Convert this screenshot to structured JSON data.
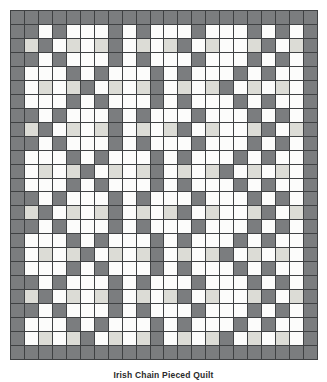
{
  "figure": {
    "title": "Irish Chain Pieced Quilt",
    "caption": "Irish Chain Pieced Quilt",
    "type": "quilt-pattern-diagram"
  },
  "palette": {
    "dark": "#7b7d7f",
    "white": "#fcfcfb",
    "light": "#dcdcd6",
    "grid_line": "#3f4143",
    "background": "#ffffff"
  },
  "chart_data": {
    "type": "heatmap",
    "title": "Irish Chain Pieced Quilt",
    "xlabel": "",
    "ylabel": "",
    "columns": 22,
    "rows": 25,
    "legend": [
      {
        "key": "D",
        "label": "dark",
        "color": "#7b7d7f"
      },
      {
        "key": "W",
        "label": "white",
        "color": "#fcfcfb"
      },
      {
        "key": "L",
        "label": "light",
        "color": "#dcdcd6"
      }
    ],
    "grid": [
      "DDDDDDDDDDDDDDDDDDDDDD",
      "DDWDWWWDWDWWWDWWWDWDWD",
      "DLDWLWLDWLWLDWLWWLDWLD",
      "DDWDWWWDWDWWWDWWWDWDWD",
      "DWWWDWDWWWDWDWWWDWDWWD",
      "DWLWLDWLWLDWLWLDWLWLWD",
      "DWWWDWDWWWDWDWWWDWDWWD",
      "DDWDWWWDWDWWWDWWWDWDWD",
      "DLDWLWLDWLWLDWLWWLDWLD",
      "DDWDWWWDWDWWWDWWWDWDWD",
      "DWWWDWDWWWDWDWWWDWDWWD",
      "DWLWLDWLWLDWLWLDWLWLWD",
      "DWWWDWDWWWDWDWWWDWDWWD",
      "DDWDWWWDWDWWWDWWWDWDWD",
      "DLDWLWLDWLWLDWLWWLDWLD",
      "DDWDWWWDWDWWWDWWWDWDWD",
      "DWWWDWDWWWDWDWWWDWDWWD",
      "DWLWLDWLWLDWLWLDWLWLWD",
      "DWWWDWDWWWDWDWWWDWDWWD",
      "DDWDWWWDWDWWWDWWWDWDWD",
      "DLDWLWLDWLWLDWLWWLDWLD",
      "DDWDWWWDWDWWWDWWWDWDWD",
      "DWWWDWDWWWDWDWWWDWDWWD",
      "DWLWLDWLWLDWLWLDWLWLWD",
      "DDDDDDDDDDDDDDDDDDDDDD"
    ]
  }
}
